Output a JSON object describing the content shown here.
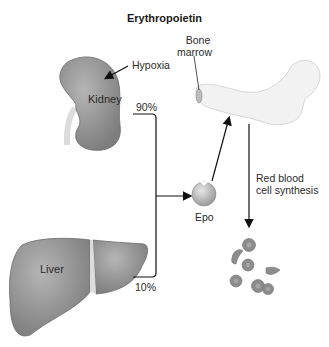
{
  "title": "Erythropoietin",
  "labels": {
    "hypoxia": "Hypoxia",
    "kidney": "Kidney",
    "kidney_pct": "90%",
    "liver": "Liver",
    "liver_pct": "10%",
    "epo": "Epo",
    "bone_marrow_line1": "Bone",
    "bone_marrow_line2": "marrow",
    "rbc_line1": "Red blood",
    "rbc_line2": "cell synthesis"
  },
  "colors": {
    "organ_fill": "#8a8a8a",
    "bone_fill": "#f2f2f2",
    "rbc_fill": "#8c8c8c",
    "arrow": "#111111"
  }
}
